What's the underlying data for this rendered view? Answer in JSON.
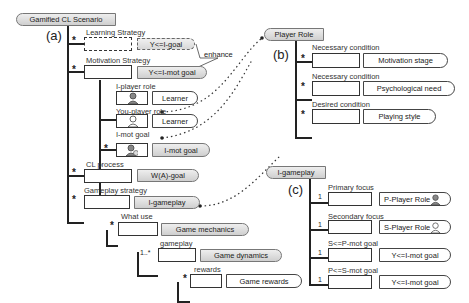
{
  "panels": {
    "a": "(a)",
    "b": "(b)",
    "c": "(c)"
  },
  "a": {
    "root": "Gamified CL Scenario",
    "learning_strategy": {
      "label": "Learning Strategy",
      "mult": "*",
      "tag": "Y<=I-goal"
    },
    "enhance": "enhance",
    "motivation_strategy": {
      "label": "Motivation Strategy",
      "mult": "*",
      "tag": "Y<=I-mot goal"
    },
    "i_player_role": {
      "label": "I-player role",
      "tag": "Learner"
    },
    "you_player_role": {
      "label": "You-player role",
      "tag": "Learner"
    },
    "i_mot_goal": {
      "label": "I-mot goal",
      "mult": "*",
      "tag": "I-mot goal"
    },
    "cl_process": {
      "label": "CL process",
      "mult": "*",
      "tag": "W(A)-goal"
    },
    "gameplay_strategy": {
      "label": "Gameplay strategy",
      "mult": "*",
      "tag": "I-gameplay"
    },
    "what_use": {
      "label": "What use",
      "mult": "*",
      "tag": "Game mechanics"
    },
    "gameplay": {
      "label": "gameplay",
      "mult": "1..*",
      "tag": "Game dynamics"
    },
    "rewards": {
      "label": "rewards",
      "mult": "*",
      "tag": "Game rewards"
    }
  },
  "b": {
    "root": "Player Role",
    "items": [
      {
        "label": "Necessary condition",
        "mult": "*",
        "tag": "Motivation stage"
      },
      {
        "label": "Necessary condition",
        "mult": "*",
        "tag": "Psychological need"
      },
      {
        "label": "Desired condition",
        "mult": "*",
        "tag": "Playing style"
      }
    ]
  },
  "c": {
    "root": "I-gameplay",
    "items": [
      {
        "label": "Primary focus",
        "mult": "1",
        "tag": "P-Player Role"
      },
      {
        "label": "Secondary focus",
        "mult": "1",
        "tag": "S-Player Role"
      },
      {
        "label": "S<=P-mot goal",
        "mult": "1",
        "tag": "Y<=I-mot goal"
      },
      {
        "label": "P<=S-mot goal",
        "mult": "1",
        "tag": "Y<=I-mot goal"
      }
    ]
  }
}
